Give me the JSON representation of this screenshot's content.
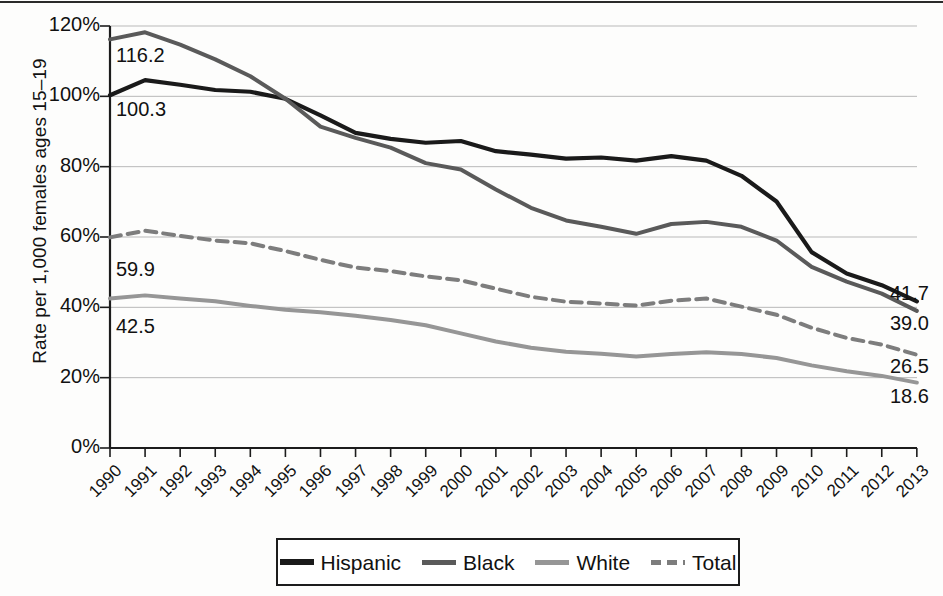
{
  "chart_data": {
    "type": "line",
    "title": "",
    "xlabel": "",
    "ylabel": "Rate per 1,000 females ages 15–19",
    "ylim": [
      0,
      120
    ],
    "yticks": [
      "0%",
      "20%",
      "40%",
      "60%",
      "80%",
      "100%",
      "120%"
    ],
    "grid": true,
    "legend_position": "bottom",
    "categories": [
      "1990",
      "1991",
      "1992",
      "1993",
      "1994",
      "1995",
      "1996",
      "1997",
      "1998",
      "1999",
      "2000",
      "2001",
      "2002",
      "2003",
      "2004",
      "2005",
      "2006",
      "2007",
      "2008",
      "2009",
      "2010",
      "2011",
      "2012",
      "2013"
    ],
    "series": [
      {
        "name": "Hispanic",
        "color": "#1a1a1a",
        "style": "solid",
        "start_label": "100.3",
        "end_label": "41.7",
        "values": [
          100.3,
          104.6,
          103.3,
          101.8,
          101.3,
          99.3,
          94.6,
          89.6,
          87.9,
          86.8,
          87.3,
          84.4,
          83.4,
          82.3,
          82.6,
          81.7,
          83.0,
          81.7,
          77.4,
          70.1,
          55.7,
          49.6,
          46.3,
          41.7
        ]
      },
      {
        "name": "Black",
        "color": "#5a5a5a",
        "style": "solid",
        "start_label": "116.2",
        "end_label": "39.0",
        "values": [
          116.2,
          118.2,
          114.7,
          110.5,
          105.7,
          99.3,
          91.4,
          88.2,
          85.4,
          81.0,
          79.2,
          73.5,
          68.3,
          64.7,
          62.9,
          60.9,
          63.7,
          64.3,
          62.9,
          59.0,
          51.5,
          47.3,
          43.9,
          39.0
        ]
      },
      {
        "name": "White",
        "color": "#969696",
        "style": "solid",
        "start_label": "42.5",
        "end_label": "18.6",
        "values": [
          42.5,
          43.4,
          42.5,
          41.7,
          40.4,
          39.3,
          38.6,
          37.6,
          36.4,
          34.9,
          32.6,
          30.3,
          28.5,
          27.4,
          26.8,
          26.0,
          26.7,
          27.2,
          26.7,
          25.6,
          23.5,
          21.8,
          20.5,
          18.6
        ]
      },
      {
        "name": "Total",
        "color": "#7d7d7d",
        "style": "dashed",
        "start_label": "59.9",
        "end_label": "26.5",
        "values": [
          59.9,
          61.8,
          60.3,
          59.0,
          58.2,
          56.0,
          53.5,
          51.3,
          50.3,
          48.8,
          47.7,
          45.3,
          43.0,
          41.6,
          41.1,
          40.5,
          41.9,
          42.5,
          40.2,
          37.9,
          34.2,
          31.3,
          29.4,
          26.5
        ]
      }
    ]
  },
  "legend": {
    "items": [
      {
        "label": "Hispanic"
      },
      {
        "label": "Black"
      },
      {
        "label": "White"
      },
      {
        "label": "Total"
      }
    ]
  }
}
